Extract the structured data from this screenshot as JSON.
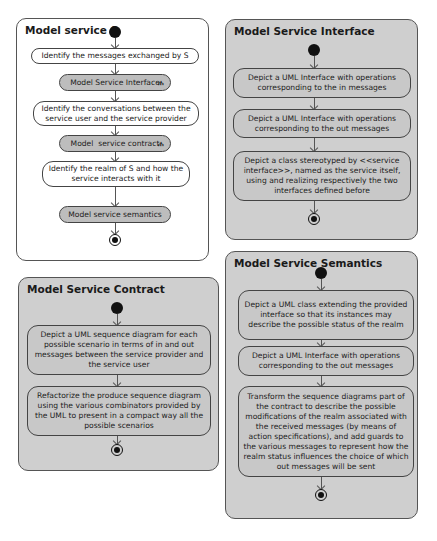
{
  "panels": {
    "service_s": {
      "title": "Model service S",
      "nodes": [
        {
          "label": "Identify the messages exchanged by S",
          "kind": "action"
        },
        {
          "label": "Model Service Interface",
          "kind": "call-activity",
          "icon": "rake-icon"
        },
        {
          "label": "Identify the conversations between the service user and the service provider",
          "kind": "action"
        },
        {
          "label": "Model  service contract",
          "kind": "call-activity",
          "icon": "rake-icon"
        },
        {
          "label": "Identify the realm of S and how the service interacts with it",
          "kind": "action"
        },
        {
          "label": "Model service semantics",
          "kind": "call-activity"
        }
      ]
    },
    "service_interface": {
      "title": "Model Service Interface",
      "nodes": [
        {
          "label": "Depict a UML Interface with operations corresponding to the in messages"
        },
        {
          "label": "Depict a UML Interface with operations corresponding to the out messages"
        },
        {
          "label": "Depict a class stereotyped by <<service interface>>, named as the service itself, using and realizing respectively the two interfaces defined before"
        }
      ]
    },
    "service_contract": {
      "title": "Model Service Contract",
      "nodes": [
        {
          "label": "Depict a UML sequence diagram for each possible scenario in terms of in and out messages between the service provider and the service user"
        },
        {
          "label": "Refactorize the produce sequence diagram using the various combinators provided by the UML to present in a compact way all the possible scenarios"
        }
      ]
    },
    "service_semantics": {
      "title": "Model Service Semantics",
      "nodes": [
        {
          "label": "Depict a UML class extending the provided interface so that its instances may describe the possible status of the realm"
        },
        {
          "label": "Depict a UML Interface with operations corresponding to the out messages"
        },
        {
          "label": "Transform the sequence diagrams part of the contract to describe the possible modifications of the realm associated with the received messages (by means of action specifications), and add guards to the various messages to represent how the realm status influences the choice of which out messages will be sent"
        }
      ]
    }
  },
  "icons": {
    "rake": "ሐ"
  },
  "colors": {
    "panel_gray": "#cfcfcf",
    "call_node": "#bdbdbd",
    "border": "#444444",
    "initial_node": "#111111"
  }
}
